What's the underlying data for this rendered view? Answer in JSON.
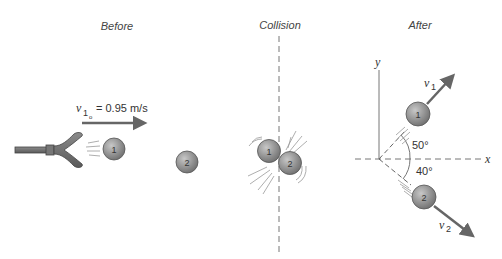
{
  "panels": {
    "before": {
      "title": "Before",
      "velocity_symbol": "v",
      "velocity_subscript": "1",
      "velocity_subsubscript": "o",
      "velocity_value": "= 0.95 m/s",
      "ball1_label": "1",
      "ball2_label": "2"
    },
    "collision": {
      "title": "Collision",
      "ball1_label": "1",
      "ball2_label": "2"
    },
    "after": {
      "title": "After",
      "y_axis_label": "y",
      "x_axis_label": "x",
      "v1_symbol": "v",
      "v1_subscript": "1",
      "v2_symbol": "v",
      "v2_subscript": "2",
      "angle1": "50°",
      "angle2": "40°",
      "ball1_label": "1",
      "ball2_label": "2"
    }
  },
  "colors": {
    "ball_fill": "#8c8c8c",
    "ball_stroke": "#555555",
    "arrow": "#666666",
    "dashed_line": "#777777",
    "text": "#333333"
  }
}
